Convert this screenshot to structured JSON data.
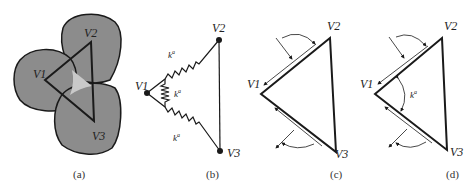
{
  "panels": [
    {
      "caption": "(a)",
      "vertices": {
        "v1": "V1",
        "v2": "V2",
        "v3": "V3"
      }
    },
    {
      "caption": "(b)",
      "vertices": {
        "v1": "V1",
        "v2": "V2",
        "v3": "V3"
      },
      "springs": {
        "upper": "k",
        "upper_sup": "a",
        "middle": "k",
        "middle_sup": "a",
        "lower": "k",
        "lower_sup": "a"
      }
    },
    {
      "caption": "(c)",
      "vertices": {
        "v1": "V1",
        "v2": "V2",
        "v3": "V3"
      }
    },
    {
      "caption": "(d)",
      "vertices": {
        "v1": "V1",
        "v2": "V2",
        "v3": "V3"
      },
      "angle_label": "k",
      "angle_label_sup": "a"
    }
  ],
  "colors": {
    "region_fill": "#8c8c8c",
    "center_fill": "#c9c9c9",
    "stroke": "#1a1a1a"
  }
}
